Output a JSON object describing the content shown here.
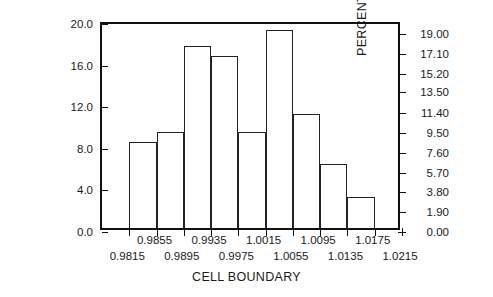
{
  "chart_data": {
    "type": "bar",
    "title": "",
    "xlabel": "CELL BOUNDARY",
    "ylabel": "CELL FREQUENCY",
    "ylabel_secondary": "PERCENT",
    "grid": false,
    "legend": false,
    "xlim": [
      0.9775,
      1.0215
    ],
    "ylim": [
      0.0,
      20.0
    ],
    "ylim_secondary": [
      0.0,
      19.0
    ],
    "yticks": [
      "0.0",
      "4.0",
      "8.0",
      "12.0",
      "16.0",
      "20.0"
    ],
    "ytick_values": [
      0.0,
      4.0,
      8.0,
      12.0,
      16.0,
      20.0
    ],
    "yticks_secondary": [
      "0.00",
      "1.90",
      "3.80",
      "5.70",
      "7.60",
      "9.50",
      "11.40",
      "13.50",
      "15.20",
      "17.10",
      "19.00"
    ],
    "ytick_secondary_values": [
      0.0,
      1.9,
      3.8,
      5.7,
      7.6,
      9.5,
      11.4,
      13.5,
      15.2,
      17.1,
      19.0
    ],
    "xticks": [
      "0.9815",
      "0.9855",
      "0.9895",
      "0.9935",
      "0.9975",
      "1.0015",
      "1.0055",
      "1.0095",
      "1.0135",
      "1.0175",
      "1.0215"
    ],
    "xtick_values": [
      0.9815,
      0.9855,
      0.9895,
      0.9935,
      0.9975,
      1.0015,
      1.0055,
      1.0095,
      1.0135,
      1.0175,
      1.0215
    ],
    "bin_edges": [
      0.9815,
      0.9855,
      0.9895,
      0.9935,
      0.9975,
      1.0015,
      1.0055,
      1.0095,
      1.0135,
      1.0175
    ],
    "categories": [
      "0.9815-0.9855",
      "0.9855-0.9895",
      "0.9895-0.9935",
      "0.9935-0.9975",
      "0.9975-1.0015",
      "1.0015-1.0055",
      "1.0055-1.0095",
      "1.0095-1.0135",
      "1.0135-1.0175"
    ],
    "values": [
      8.3,
      9.2,
      17.5,
      16.5,
      9.2,
      19.0,
      11.0,
      6.2,
      3.0
    ]
  }
}
